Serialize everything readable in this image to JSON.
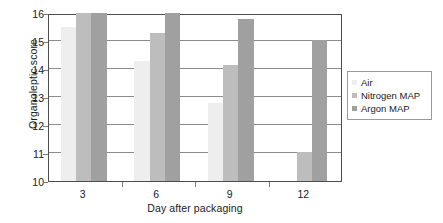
{
  "chart_data": {
    "type": "bar",
    "title": "",
    "xlabel": "Day after packaging",
    "ylabel": "Organoleptic score",
    "categories": [
      "3",
      "6",
      "9",
      "12"
    ],
    "ylim": [
      10,
      16
    ],
    "yticks": [
      10,
      11,
      12,
      13,
      14,
      15,
      16
    ],
    "ytick_labels": [
      "10",
      "11",
      "12",
      "13",
      "14",
      "15",
      "16"
    ],
    "grid": true,
    "legend_position": "right",
    "series": [
      {
        "name": "Air",
        "color": "#eeeeee",
        "values": [
          15.5,
          14.3,
          12.8,
          null
        ]
      },
      {
        "name": "Nitrogen MAP",
        "color": "#bdbdbd",
        "values": [
          16.0,
          15.3,
          14.15,
          11.05
        ]
      },
      {
        "name": "Argon MAP",
        "color": "#a0a0a0",
        "values": [
          16.0,
          16.0,
          15.8,
          15.05
        ]
      }
    ]
  },
  "legend": {
    "items": [
      {
        "label": "Air"
      },
      {
        "label": "Nitrogen MAP"
      },
      {
        "label": "Argon MAP"
      }
    ]
  },
  "axes": {
    "ylabel": "Organoleptic score",
    "xlabel": "Day after packaging"
  }
}
